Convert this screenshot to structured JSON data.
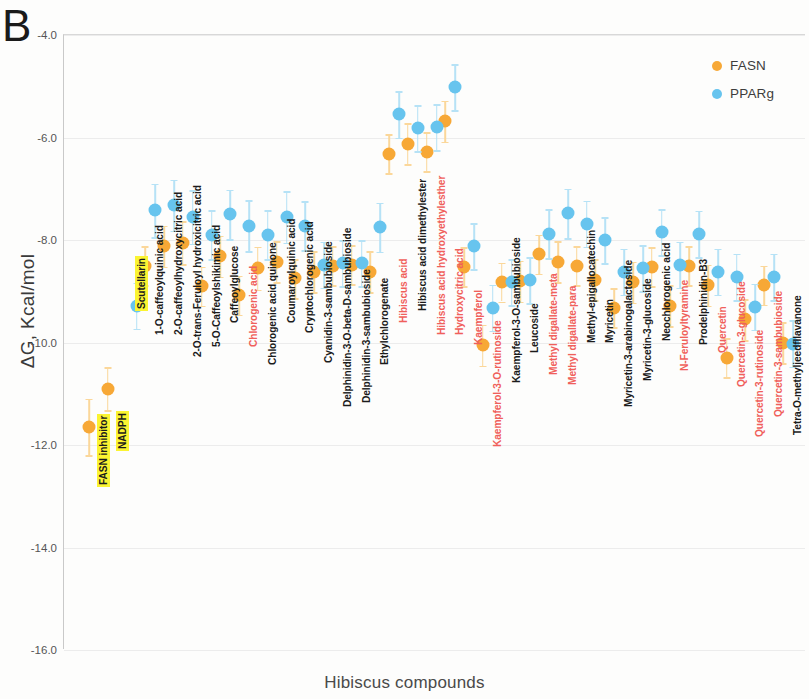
{
  "panel": {
    "letter": "B"
  },
  "legend": {
    "position": "top-right",
    "entries": [
      {
        "label": "FASN",
        "color": "#f7a836"
      },
      {
        "label": "PPARg",
        "color": "#67c4ee"
      }
    ]
  },
  "axes": {
    "ylabel": "ΔG, Kcal/mol",
    "xlabel": "Hibiscus compounds",
    "yticks": [
      "-4.0",
      "-6.0",
      "-8.0",
      "-10.0",
      "-12.0",
      "-14.0",
      "-16.0"
    ],
    "ymin": -16.0,
    "ymax": -4.0
  },
  "chart_data": {
    "type": "scatter",
    "title": "B",
    "xlabel": "Hibiscus compounds",
    "ylabel": "ΔG, Kcal/mol",
    "ylim": [
      -16.0,
      -4.0
    ],
    "grid": true,
    "legend_position": "top-right",
    "series_names": [
      "FASN",
      "PPARg"
    ],
    "series_colors": [
      "#f7a836",
      "#67c4ee"
    ],
    "categories": [
      "FASN inhibitor",
      "NADPH",
      "Scutellarin",
      "1-O-caffeoylquinic acid",
      "2-O-caffeoylhydroxycitric acid",
      "2-O-trans-Feruloyl hydroxicitric acid",
      "5-O-Caffeoylshikimic acid",
      "Caffeoylglucose",
      "Chlorogenic acid",
      "Chlorogenic acid quinone",
      "Coumaroylquinic acid",
      "Cryptochlorogenic acid",
      "Cyanidin-3-sambubioside",
      "Delphinidin-3-O-beta-D-sambubioside",
      "Delphinidin-3-sambubioside",
      "Ethylchlorogenate",
      "Hibiscus acid",
      "Hibiscus acid dimethylester",
      "Hibiscus acid hydroxyethylesther",
      "Hydroxycitric acid",
      "Kaempferol",
      "Kaempferol-3-O-rutinoside",
      "Kaempferol-3-O-sambubioside",
      "Leucoside",
      "Methyl digallate-meta",
      "Methyl digallate-para",
      "Methyl-epigallocatechin",
      "Myricetin",
      "Myricetin-3-arabinogalactoside",
      "Myricetin-3-glucoside",
      "Neochlorogenic acid",
      "N-Feruloyltyramine",
      "Prodelphinidin-B3",
      "Quercetin",
      "Quercetin-3-glucoside",
      "Quercetin-3-rutinoside",
      "Quercetin-3-sambubioside",
      "Tetra-O-methyljeedfllavanone"
    ],
    "category_label_colors": [
      "highlight",
      "highlight",
      "highlight",
      "black",
      "black",
      "black",
      "black",
      "black",
      "red",
      "black",
      "black",
      "black",
      "black",
      "black",
      "black",
      "black",
      "red",
      "black",
      "red",
      "red",
      "red",
      "red",
      "black",
      "black",
      "red",
      "red",
      "black",
      "black",
      "black",
      "black",
      "black",
      "red",
      "black",
      "red",
      "red",
      "red",
      "red",
      "black"
    ],
    "series": [
      {
        "name": "FASN",
        "values": [
          -11.65,
          -10.9,
          null,
          -8.5,
          -8.12,
          -8.05,
          -8.9,
          -8.32,
          -9.08,
          -8.55,
          -8.42,
          -8.75,
          -8.62,
          -8.5,
          -8.48,
          -8.62,
          -6.32,
          -6.12,
          -6.28,
          -5.68,
          -8.52,
          -10.05,
          -8.82,
          -8.8,
          -8.28,
          -8.42,
          -8.5,
          -8.78,
          -9.32,
          -8.82,
          -8.52,
          -9.28,
          -8.5,
          -8.88,
          -10.3,
          -9.55,
          -8.88,
          -10.0
        ],
        "errors": [
          0.55,
          0.42,
          null,
          0.38,
          0.4,
          0.42,
          0.38,
          0.4,
          0.38,
          0.42,
          0.4,
          0.38,
          0.4,
          0.38,
          0.38,
          0.4,
          0.38,
          0.4,
          0.38,
          0.4,
          0.38,
          0.4,
          0.38,
          0.4,
          0.38,
          0.4,
          0.38,
          0.4,
          0.38,
          0.4,
          0.38,
          0.4,
          0.38,
          0.4,
          0.38,
          0.4,
          0.38,
          0.4
        ]
      },
      {
        "name": "PPARg",
        "values": [
          null,
          null,
          -9.28,
          -7.42,
          -7.32,
          -7.55,
          -7.9,
          -7.5,
          -7.72,
          -7.9,
          -7.55,
          -7.72,
          -8.48,
          -8.45,
          -8.45,
          -7.75,
          -5.55,
          -5.82,
          -5.8,
          -5.02,
          -8.12,
          -9.32,
          -8.82,
          -8.78,
          -7.88,
          -7.48,
          -7.68,
          -8.0,
          -8.62,
          -8.55,
          -7.85,
          -8.48,
          -7.88,
          -8.62,
          -8.72,
          -9.3,
          -8.72,
          -10.02
        ],
        "errors": [
          null,
          null,
          0.45,
          0.52,
          0.5,
          0.52,
          0.48,
          0.48,
          0.5,
          0.48,
          0.5,
          0.48,
          0.45,
          0.45,
          0.45,
          0.48,
          0.45,
          0.45,
          0.45,
          0.45,
          0.45,
          0.45,
          0.45,
          0.45,
          0.48,
          0.48,
          0.45,
          0.45,
          0.45,
          0.45,
          0.45,
          0.45,
          0.45,
          0.45,
          0.45,
          0.45,
          0.45,
          0.45
        ]
      }
    ]
  },
  "category_label_y": [
    452,
    416,
    276,
    300,
    300,
    322,
    312,
    288,
    312,
    330,
    288,
    298,
    328,
    372,
    368,
    330,
    288,
    276,
    300,
    300,
    310,
    412,
    348,
    318,
    340,
    350,
    308,
    308,
    372,
    346,
    306,
    336,
    310,
    318,
    352,
    402,
    382,
    400
  ]
}
